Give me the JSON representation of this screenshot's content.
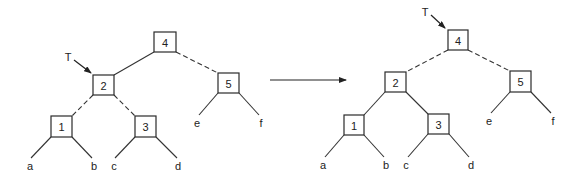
{
  "diagram": {
    "transition_arrow": {
      "from": [
        270,
        80
      ],
      "to": [
        346,
        80
      ]
    },
    "left_tree": {
      "pointer_label": "T",
      "pointer_target": "2",
      "pointer": {
        "label_pos": [
          68,
          57
        ],
        "from": [
          74,
          60
        ],
        "to": [
          91,
          73
        ]
      },
      "nodes": [
        {
          "id": "4",
          "label": "4",
          "x": 154,
          "y": 32,
          "w": 22,
          "h": 20
        },
        {
          "id": "2",
          "label": "2",
          "x": 93,
          "y": 75,
          "w": 21,
          "h": 20
        },
        {
          "id": "5",
          "label": "5",
          "x": 218,
          "y": 73,
          "w": 21,
          "h": 20
        },
        {
          "id": "1",
          "label": "1",
          "x": 51,
          "y": 116,
          "w": 21,
          "h": 21
        },
        {
          "id": "3",
          "label": "3",
          "x": 135,
          "y": 116,
          "w": 21,
          "h": 21
        }
      ],
      "leaves": [
        {
          "label": "a",
          "x": 30,
          "y": 166
        },
        {
          "label": "b",
          "x": 94,
          "y": 166
        },
        {
          "label": "c",
          "x": 114,
          "y": 166
        },
        {
          "label": "d",
          "x": 178,
          "y": 166
        },
        {
          "label": "e",
          "x": 197,
          "y": 123
        },
        {
          "label": "f",
          "x": 261,
          "y": 123
        }
      ],
      "edges": [
        {
          "from": "4",
          "to": "2",
          "style": "solid",
          "x1": 154,
          "y1": 52,
          "x2": 114,
          "y2": 75
        },
        {
          "from": "4",
          "to": "5",
          "style": "dashed",
          "x1": 176,
          "y1": 52,
          "x2": 218,
          "y2": 73
        },
        {
          "from": "2",
          "to": "1",
          "style": "dashed",
          "x1": 93,
          "y1": 95,
          "x2": 72,
          "y2": 116
        },
        {
          "from": "2",
          "to": "3",
          "style": "dashed",
          "x1": 114,
          "y1": 95,
          "x2": 135,
          "y2": 116
        },
        {
          "from": "1",
          "to": "a",
          "style": "solid",
          "x1": 51,
          "y1": 137,
          "x2": 31,
          "y2": 158
        },
        {
          "from": "1",
          "to": "b",
          "style": "solid",
          "x1": 72,
          "y1": 137,
          "x2": 92,
          "y2": 158
        },
        {
          "from": "3",
          "to": "c",
          "style": "solid",
          "x1": 135,
          "y1": 137,
          "x2": 115,
          "y2": 158
        },
        {
          "from": "3",
          "to": "d",
          "style": "solid",
          "x1": 156,
          "y1": 137,
          "x2": 177,
          "y2": 158
        },
        {
          "from": "5",
          "to": "e",
          "style": "solid",
          "x1": 218,
          "y1": 93,
          "x2": 199,
          "y2": 115
        },
        {
          "from": "5",
          "to": "f",
          "style": "solid",
          "x1": 239,
          "y1": 93,
          "x2": 259,
          "y2": 115
        }
      ]
    },
    "right_tree": {
      "pointer_label": "T",
      "pointer_target": "4",
      "pointer": {
        "label_pos": [
          425,
          12
        ],
        "from": [
          431,
          15
        ],
        "to": [
          445,
          28
        ]
      },
      "nodes": [
        {
          "id": "4",
          "label": "4",
          "x": 448,
          "y": 30,
          "w": 20,
          "h": 20
        },
        {
          "id": "2",
          "label": "2",
          "x": 385,
          "y": 72,
          "w": 21,
          "h": 20
        },
        {
          "id": "5",
          "label": "5",
          "x": 510,
          "y": 71,
          "w": 21,
          "h": 21
        },
        {
          "id": "1",
          "label": "1",
          "x": 344,
          "y": 115,
          "w": 20,
          "h": 20
        },
        {
          "id": "3",
          "label": "3",
          "x": 428,
          "y": 114,
          "w": 21,
          "h": 20
        }
      ],
      "leaves": [
        {
          "label": "a",
          "x": 323,
          "y": 165
        },
        {
          "label": "b",
          "x": 386,
          "y": 165
        },
        {
          "label": "c",
          "x": 406,
          "y": 165
        },
        {
          "label": "d",
          "x": 471,
          "y": 165
        },
        {
          "label": "e",
          "x": 489,
          "y": 121
        },
        {
          "label": "f",
          "x": 553,
          "y": 121
        }
      ],
      "edges": [
        {
          "from": "4",
          "to": "2",
          "style": "dashed",
          "x1": 448,
          "y1": 50,
          "x2": 406,
          "y2": 72
        },
        {
          "from": "4",
          "to": "5",
          "style": "dashed",
          "x1": 468,
          "y1": 50,
          "x2": 510,
          "y2": 71
        },
        {
          "from": "2",
          "to": "1",
          "style": "solid",
          "x1": 385,
          "y1": 92,
          "x2": 364,
          "y2": 115
        },
        {
          "from": "2",
          "to": "3",
          "style": "solid",
          "x1": 406,
          "y1": 92,
          "x2": 428,
          "y2": 114
        },
        {
          "from": "1",
          "to": "a",
          "style": "solid",
          "x1": 344,
          "y1": 135,
          "x2": 325,
          "y2": 157
        },
        {
          "from": "1",
          "to": "b",
          "style": "solid",
          "x1": 364,
          "y1": 135,
          "x2": 384,
          "y2": 157
        },
        {
          "from": "3",
          "to": "c",
          "style": "solid",
          "x1": 428,
          "y1": 134,
          "x2": 408,
          "y2": 157
        },
        {
          "from": "3",
          "to": "d",
          "style": "solid",
          "x1": 449,
          "y1": 134,
          "x2": 469,
          "y2": 157
        },
        {
          "from": "5",
          "to": "e",
          "style": "solid",
          "x1": 510,
          "y1": 92,
          "x2": 491,
          "y2": 113
        },
        {
          "from": "5",
          "to": "f",
          "style": "solid",
          "x1": 531,
          "y1": 92,
          "x2": 551,
          "y2": 113
        }
      ]
    }
  }
}
